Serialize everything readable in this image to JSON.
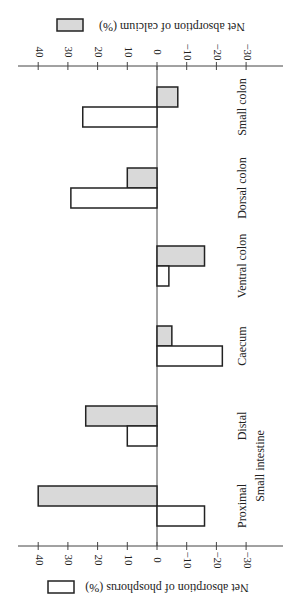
{
  "chart_data": {
    "type": "bar",
    "orientation": "figure rotated 90 degrees clockwise",
    "categories": [
      "Proximal",
      "Distal",
      "Caecum",
      "Ventral colon",
      "Dorsal colon",
      "Small colon"
    ],
    "group_label": "Small intestine",
    "group_members": [
      "Proximal",
      "Distal"
    ],
    "series": [
      {
        "name": "Net absorption of phosphorus (%)",
        "key": "phosphorus",
        "fill": "#ffffff",
        "values": [
          -16,
          10,
          -22,
          -4,
          29,
          25
        ]
      },
      {
        "name": "Net absorption of calcium (%)",
        "key": "calcium",
        "fill": "#d9d9d9",
        "values": [
          40,
          24,
          -5,
          -16,
          10,
          -7
        ]
      }
    ],
    "value_axis": {
      "ticks": [
        40,
        30,
        20,
        10,
        0,
        -10,
        -20,
        -30
      ],
      "tick_labels": [
        "40",
        "30",
        "20",
        "10",
        "0",
        "−10",
        "−20",
        "−30"
      ],
      "range": [
        -33,
        44
      ]
    },
    "legends": [
      {
        "label": "Net absorption of phosphorus (%)",
        "series": "phosphorus",
        "placement": "bottom"
      },
      {
        "label": "Net absorption of calcium (%)",
        "series": "calcium",
        "placement": "top"
      }
    ],
    "grid": false,
    "title": ""
  }
}
